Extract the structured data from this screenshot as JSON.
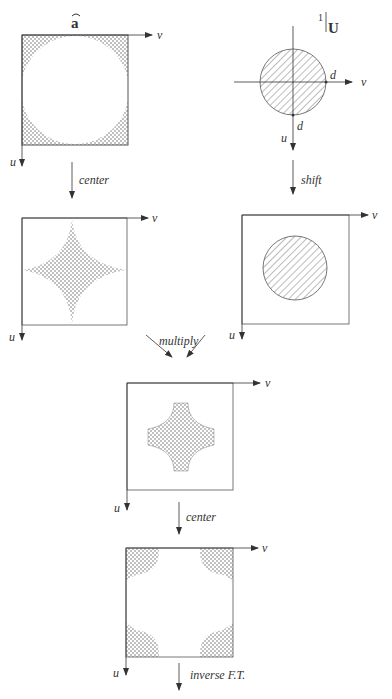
{
  "figure": {
    "panels": [
      {
        "id": "a-hat",
        "title": "a",
        "title_accent": "hat",
        "axis_h": "v",
        "axis_v": "u",
        "shape": "square with circular hole, stippled corners"
      },
      {
        "id": "U",
        "title_prefix": "1",
        "title": "U",
        "axis_h": "v",
        "axis_v": "u",
        "marker_h": "d",
        "marker_v": "d",
        "shape": "hatched disc centered at origin"
      },
      {
        "id": "a-hat-centered",
        "axis_h": "v",
        "axis_v": "u",
        "shape": "stippled astroid (concave star)"
      },
      {
        "id": "U-shifted",
        "axis_h": "v",
        "axis_v": "u",
        "shape": "hatched disc at square center"
      },
      {
        "id": "product",
        "axis_h": "v",
        "axis_v": "u",
        "shape": "stippled rounded cross"
      },
      {
        "id": "product-centered",
        "axis_h": "v",
        "axis_v": "u",
        "shape": "stippled corner pieces"
      }
    ],
    "operations": {
      "center_1": "center",
      "shift": "shift",
      "multiply": "multiply",
      "center_2": "center",
      "inverse_ft": "inverse F.T."
    },
    "colors": {
      "ink": "#333333",
      "stipple": "#555555",
      "background": "#ffffff"
    }
  }
}
